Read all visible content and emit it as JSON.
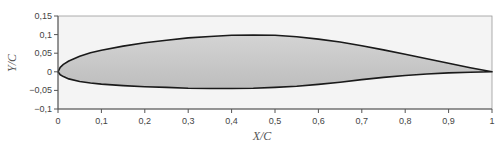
{
  "chart_data": {
    "type": "area",
    "title": "",
    "xlabel": "X/C",
    "ylabel": "Y/C",
    "xlim": [
      0,
      1
    ],
    "ylim": [
      -0.1,
      0.15
    ],
    "grid": false,
    "legend": null,
    "x_ticks": [
      "0",
      "0,1",
      "0,2",
      "0,3",
      "0,4",
      "0,5",
      "0,6",
      "0,7",
      "0,8",
      "0,9",
      "1"
    ],
    "y_ticks": [
      "0,15",
      "0,1",
      "0,05",
      "0",
      "−0,05",
      "−0,1"
    ],
    "series": [
      {
        "name": "upper surface",
        "x": [
          0,
          0.005,
          0.0125,
          0.025,
          0.05,
          0.075,
          0.1,
          0.15,
          0.2,
          0.25,
          0.3,
          0.35,
          0.4,
          0.45,
          0.5,
          0.55,
          0.6,
          0.65,
          0.7,
          0.75,
          0.8,
          0.85,
          0.9,
          0.95,
          1.0
        ],
        "values": [
          0,
          0.012,
          0.02,
          0.029,
          0.042,
          0.051,
          0.058,
          0.069,
          0.078,
          0.085,
          0.091,
          0.095,
          0.098,
          0.099,
          0.098,
          0.094,
          0.088,
          0.08,
          0.07,
          0.059,
          0.047,
          0.035,
          0.023,
          0.011,
          0
        ]
      },
      {
        "name": "lower surface",
        "x": [
          0,
          0.005,
          0.0125,
          0.025,
          0.05,
          0.075,
          0.1,
          0.15,
          0.2,
          0.25,
          0.3,
          0.35,
          0.4,
          0.45,
          0.5,
          0.55,
          0.6,
          0.65,
          0.7,
          0.75,
          0.8,
          0.85,
          0.9,
          0.95,
          1.0
        ],
        "values": [
          0,
          -0.008,
          -0.013,
          -0.019,
          -0.026,
          -0.03,
          -0.033,
          -0.037,
          -0.04,
          -0.042,
          -0.044,
          -0.045,
          -0.045,
          -0.044,
          -0.042,
          -0.039,
          -0.034,
          -0.028,
          -0.021,
          -0.015,
          -0.01,
          -0.006,
          -0.003,
          -0.001,
          0
        ]
      }
    ],
    "fill_color": "#c8c8c8",
    "line_color": "#1a1a1a"
  },
  "axes": {
    "x_title": "X/C",
    "y_title": "Y/C"
  }
}
